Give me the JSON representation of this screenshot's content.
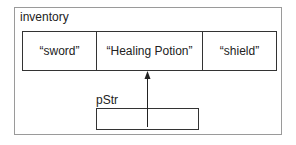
{
  "diagram": {
    "container_label": "inventory",
    "elements": [
      "“sword”",
      "“Healing Potion”",
      "“shield”"
    ],
    "pointer": {
      "label": "pStr",
      "points_to_index": 1
    },
    "colors": {
      "outer_border": "#9a9a9a",
      "line": "#333333"
    }
  }
}
